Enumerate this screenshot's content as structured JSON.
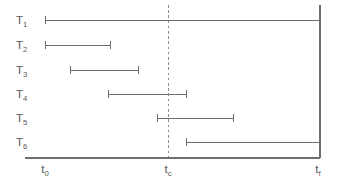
{
  "figure": {
    "width": 339,
    "height": 185,
    "background_color": "#ffffff",
    "stroke_color": "#6e6e70",
    "text_color": "#58585a",
    "dashed_line_color": "#8d8d90"
  },
  "chart_data": {
    "type": "bar",
    "orientation": "horizontal",
    "subtype": "gantt-interval-timeline",
    "title": "",
    "xlabel": "",
    "ylabel": "",
    "grid": false,
    "legend": null,
    "axis": {
      "x_start_px": 25,
      "x_end_px": 320,
      "baseline_y_px": 158,
      "right_axis_x_px": 320,
      "right_axis_top_y_px": 5,
      "x_domain_label_start": "t0",
      "x_domain_label_end": "tf"
    },
    "tick_labels": [
      {
        "id": "t0",
        "base": "t",
        "subscript": "0",
        "x_px": 45
      },
      {
        "id": "tc",
        "base": "t",
        "subscript": "c",
        "x_px": 168
      },
      {
        "id": "tf",
        "base": "t",
        "subscript": "f",
        "x_px": 318
      }
    ],
    "annotations": [
      {
        "name": "critical-time-line",
        "kind": "vertical-dashed-line",
        "x_px": 168,
        "label": "tc",
        "y_top_px": 5,
        "y_bottom_px": 158
      }
    ],
    "categories": [
      "T1",
      "T2",
      "T3",
      "T4",
      "T5",
      "T6"
    ],
    "tasks": [
      {
        "id": "T1",
        "base": "T",
        "subscript": "1",
        "row_y_px": 20,
        "start_px": 45,
        "end_px": 320,
        "label_x_px": 16
      },
      {
        "id": "T2",
        "base": "T",
        "subscript": "2",
        "row_y_px": 45,
        "start_px": 45,
        "end_px": 110,
        "label_x_px": 16
      },
      {
        "id": "T3",
        "base": "T",
        "subscript": "3",
        "row_y_px": 70,
        "start_px": 70,
        "end_px": 138,
        "label_x_px": 16
      },
      {
        "id": "T4",
        "base": "T",
        "subscript": "4",
        "row_y_px": 94,
        "start_px": 108,
        "end_px": 186,
        "label_x_px": 16
      },
      {
        "id": "T5",
        "base": "T",
        "subscript": "5",
        "row_y_px": 118,
        "start_px": 157,
        "end_px": 233,
        "label_x_px": 16
      },
      {
        "id": "T6",
        "base": "T",
        "subscript": "6",
        "row_y_px": 142,
        "start_px": 186,
        "end_px": 320,
        "label_x_px": 16
      }
    ],
    "cap_half_height_px": 4
  }
}
